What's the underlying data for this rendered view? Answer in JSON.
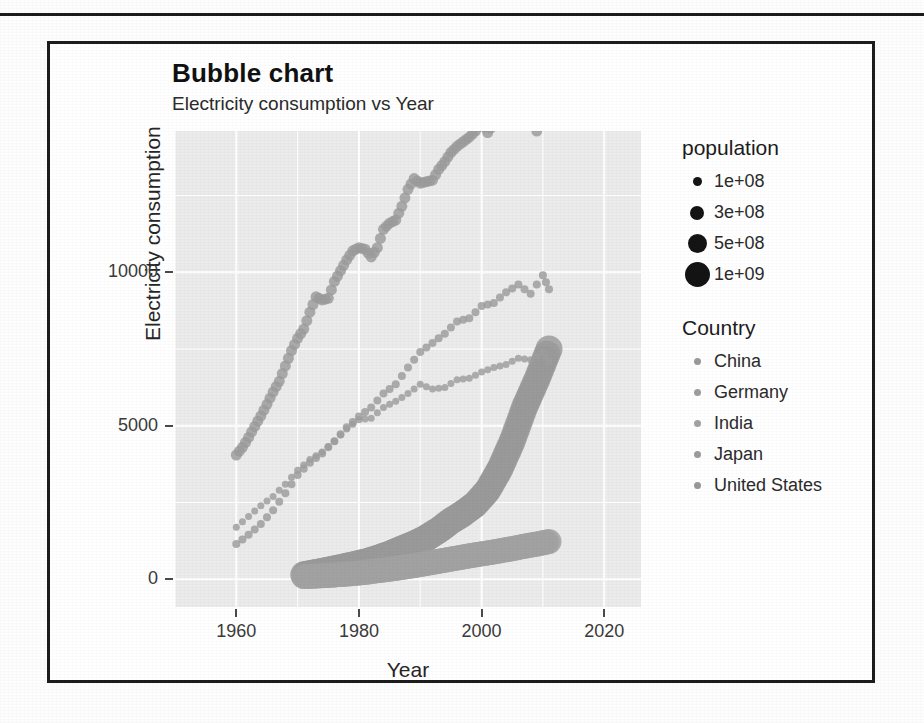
{
  "figure": {
    "title": "Bubble chart",
    "subtitle": "Electricity consumption vs Year"
  },
  "population_legend": {
    "title": "population",
    "items": [
      {
        "label": "1e+08",
        "size": 9
      },
      {
        "label": "3e+08",
        "size": 14
      },
      {
        "label": "5e+08",
        "size": 19
      },
      {
        "label": "1e+09",
        "size": 25
      }
    ]
  },
  "country_legend": {
    "title": "Country",
    "items": [
      {
        "label": "China",
        "color": "#9a9a9a"
      },
      {
        "label": "Germany",
        "color": "#9e9e9e"
      },
      {
        "label": "India",
        "color": "#a2a2a2"
      },
      {
        "label": "Japan",
        "color": "#9c9c9c"
      },
      {
        "label": "United States",
        "color": "#989898"
      }
    ]
  },
  "chart_data": {
    "type": "scatter",
    "title": "Bubble chart",
    "subtitle": "Electricity consumption vs Year",
    "xlabel": "Year",
    "ylabel": "Electricity consumption",
    "xlim": [
      1950,
      2026
    ],
    "ylim": [
      -900,
      14600
    ],
    "xticks": [
      1960,
      1980,
      2000,
      2020
    ],
    "yticks": [
      0,
      5000,
      10000
    ],
    "grid": true,
    "legend_position": "right",
    "size_encoding": "population",
    "point_color": "#9b9b9b",
    "panel_background": "#ebebeb",
    "grid_color": "#ffffff",
    "series": [
      {
        "name": "United States",
        "color": "#9b9b9b",
        "population": 250000000,
        "bubble_px": 11,
        "x": [
          1960,
          1961,
          1962,
          1963,
          1964,
          1965,
          1966,
          1967,
          1968,
          1969,
          1970,
          1971,
          1972,
          1973,
          1974,
          1975,
          1976,
          1977,
          1978,
          1979,
          1980,
          1981,
          1982,
          1983,
          1984,
          1985,
          1986,
          1987,
          1988,
          1989,
          1990,
          1991,
          1992,
          1993,
          1994,
          1995,
          1996,
          1997,
          1998,
          1999,
          2000,
          2001,
          2002,
          2003,
          2004,
          2005,
          2006,
          2007,
          2008,
          2009,
          2010,
          2011
        ],
        "y": [
          4050,
          4300,
          4620,
          4980,
          5320,
          5700,
          6100,
          6450,
          6950,
          7450,
          7850,
          8150,
          8700,
          9200,
          9100,
          9150,
          9700,
          10050,
          10400,
          10700,
          10800,
          10750,
          10500,
          10800,
          11400,
          11600,
          11700,
          12150,
          12700,
          13050,
          12900,
          12950,
          13000,
          13350,
          13600,
          13900,
          14100,
          14250,
          14400,
          14600,
          14900,
          14550,
          14850,
          14950,
          15200,
          15400,
          15350,
          15700,
          15450,
          14600,
          15200,
          15050
        ],
        "_note": "topmost curve; rises from ~4000 in 1960 to ~13600 peak near 2007 then dips"
      },
      {
        "name": "Japan",
        "color": "#9c9c9c",
        "population": 127000000,
        "bubble_px": 8,
        "x": [
          1960,
          1962,
          1964,
          1966,
          1968,
          1970,
          1972,
          1974,
          1976,
          1978,
          1980,
          1982,
          1984,
          1986,
          1988,
          1990,
          1992,
          1994,
          1996,
          1998,
          2000,
          2002,
          2004,
          2006,
          2008,
          2010,
          2011
        ],
        "y": [
          1150,
          1450,
          1800,
          2250,
          2800,
          3400,
          3800,
          4100,
          4500,
          4950,
          5300,
          5600,
          6050,
          6350,
          6900,
          7400,
          7700,
          8000,
          8400,
          8500,
          8900,
          9000,
          9350,
          9600,
          9300,
          9900,
          9450
        ],
        "_note": "lower-middle curve at start, crosses Germany near 1990"
      },
      {
        "name": "Germany",
        "color": "#9e9e9e",
        "population": 80000000,
        "bubble_px": 7,
        "x": [
          1960,
          1962,
          1964,
          1966,
          1968,
          1970,
          1972,
          1974,
          1976,
          1978,
          1980,
          1982,
          1984,
          1986,
          1988,
          1990,
          1992,
          1994,
          1996,
          1998,
          2000,
          2002,
          2004,
          2006,
          2008,
          2010,
          2011
        ],
        "y": [
          1700,
          2050,
          2400,
          2700,
          3100,
          3550,
          3900,
          4150,
          4500,
          4900,
          5200,
          5250,
          5600,
          5800,
          6050,
          6350,
          6200,
          6250,
          6500,
          6550,
          6750,
          6900,
          7000,
          7200,
          7150,
          7400,
          7100
        ],
        "_note": "upper-middle curve at start, flattens after 1990"
      },
      {
        "name": "China",
        "color": "#9a9a9a",
        "population": 1330000000,
        "bubble_px": 27,
        "x": [
          1971,
          1973,
          1975,
          1977,
          1979,
          1981,
          1983,
          1985,
          1987,
          1989,
          1991,
          1993,
          1995,
          1997,
          1999,
          2001,
          2003,
          2005,
          2007,
          2009,
          2011
        ],
        "y": [
          150,
          220,
          300,
          380,
          470,
          560,
          680,
          820,
          990,
          1150,
          1350,
          1600,
          1900,
          2150,
          2450,
          2900,
          3600,
          4500,
          5600,
          6500,
          7500
        ],
        "_note": "huge bubbles; flat and low until ~2000 then steep rise to ~3500 on the panel scale"
      },
      {
        "name": "India",
        "color": "#a2a2a2",
        "population": 1180000000,
        "bubble_px": 25,
        "x": [
          1971,
          1973,
          1975,
          1977,
          1979,
          1981,
          1983,
          1985,
          1987,
          1989,
          1991,
          1993,
          1995,
          1997,
          1999,
          2001,
          2003,
          2005,
          2007,
          2009,
          2011
        ],
        "y": [
          90,
          110,
          130,
          160,
          190,
          230,
          280,
          330,
          390,
          450,
          520,
          590,
          660,
          730,
          800,
          860,
          930,
          1000,
          1080,
          1150,
          1230
        ],
        "_note": "huge bubbles; near-flat band just above zero rising slightly"
      }
    ]
  }
}
